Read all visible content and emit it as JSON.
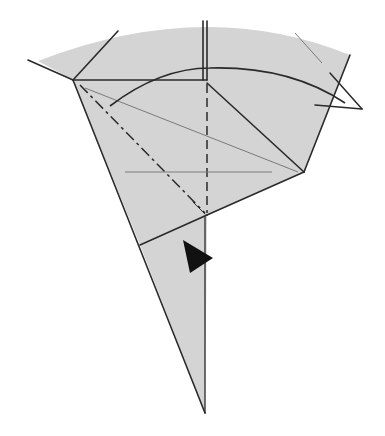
{
  "diagram": {
    "type": "origami-folding-step",
    "colors": {
      "paper": "#d4d4d4",
      "line": "#2a2a2a",
      "thin_line": "#7a7a7a",
      "background": "#ffffff",
      "arrowhead": "#111111"
    },
    "symbols": [
      {
        "name": "valley-fold-line",
        "style": "dashed"
      },
      {
        "name": "mountain-fold-line",
        "style": "dash-dot"
      },
      {
        "name": "fold-direction-arrow",
        "style": "curved"
      },
      {
        "name": "push-arrow",
        "style": "filled-triangle"
      }
    ]
  }
}
